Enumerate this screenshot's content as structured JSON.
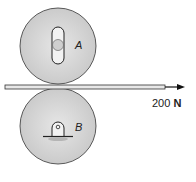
{
  "diagram": {
    "rollers": [
      {
        "id": "A",
        "label": "A",
        "support": "slotted-pin"
      },
      {
        "id": "B",
        "label": "B",
        "support": "fixed-pin"
      }
    ],
    "force": {
      "value": "200",
      "unit": "N"
    },
    "colors": {
      "roller_fill": "#d4d4d4",
      "outline": "#222222",
      "strip": "#e8e8e8"
    }
  }
}
